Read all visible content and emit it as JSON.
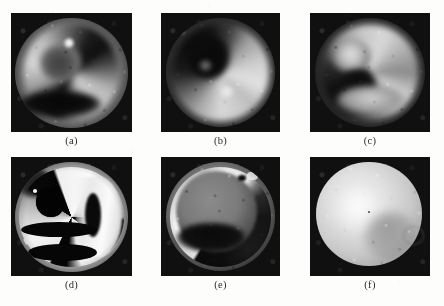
{
  "figure": {
    "background_color": "#fdfdfc",
    "layout": {
      "rows": 2,
      "columns": 3
    },
    "panels": [
      {
        "id": "a",
        "caption": "(a)",
        "kind": "grayscale-medical-image",
        "description": "circular tomographic slice, bright mid-gray ring with dark crescent lower-left and a small bright hot spot upper-center",
        "x": 11,
        "y": 13,
        "width": 121,
        "height": 119,
        "background_color": "#101010",
        "caption_x": 11,
        "caption_y": 135,
        "caption_width": 121
      },
      {
        "id": "b",
        "caption": "(b)",
        "kind": "grayscale-medical-image",
        "description": "circular slice with dark central and upper-left defect, bright speckled ring on right and lower side",
        "x": 161,
        "y": 13,
        "width": 119,
        "height": 119,
        "background_color": "#0f0f0f",
        "caption_x": 161,
        "caption_y": 135,
        "caption_width": 119
      },
      {
        "id": "c",
        "caption": "(c)",
        "kind": "grayscale-medical-image",
        "description": "circular slice, bright blob upper-left inside a broken annulus, dark hole at center-lower-left",
        "x": 310,
        "y": 13,
        "width": 120,
        "height": 119,
        "background_color": "#0e0e0e",
        "caption_x": 310,
        "caption_y": 135,
        "caption_width": 120
      },
      {
        "id": "d",
        "caption": "(d)",
        "kind": "grayscale-segmented-image",
        "description": "high-contrast thresholded result: white bands separated by pure-black arcs, black oval hole upper-left of center",
        "x": 11,
        "y": 157,
        "width": 121,
        "height": 119,
        "background_color": "#0a0a0a",
        "caption_x": 11,
        "caption_y": 279,
        "caption_width": 121
      },
      {
        "id": "e",
        "caption": "(e)",
        "kind": "grayscale-segmented-image",
        "description": "bright crescent along right and bottom rim, smooth gray interior with dark band across lower middle",
        "x": 161,
        "y": 157,
        "width": 119,
        "height": 119,
        "background_color": "#0d0d0d",
        "caption_x": 161,
        "caption_y": 279,
        "caption_width": 119
      },
      {
        "id": "f",
        "caption": "(f)",
        "kind": "grayscale-smoothed-image",
        "description": "single bright smooth filled disc, brightest upper-left, fading to gray lower-right on black background",
        "x": 310,
        "y": 157,
        "width": 120,
        "height": 119,
        "background_color": "#131313",
        "caption_x": 310,
        "caption_y": 279,
        "caption_width": 120
      }
    ]
  }
}
